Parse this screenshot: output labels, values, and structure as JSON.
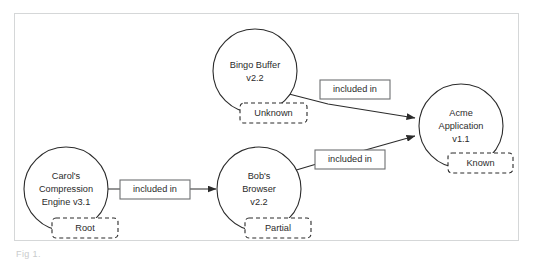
{
  "diagram": {
    "type": "dependency-graph",
    "caption": "Fig 1.",
    "frame_color": "#d5d7d8",
    "stroke_color": "#2b2b2b",
    "label_box_stroke": "#6e7072",
    "background": "#ffffff",
    "nodes": [
      {
        "id": "bingo-buffer",
        "name": "Bingo Buffer",
        "line1": "Bingo Buffer",
        "line2": "v2.2",
        "badge": "Unknown",
        "cx": 255,
        "cy": 71,
        "r": 42
      },
      {
        "id": "acme-application",
        "name": "Acme Application",
        "line1": "Acme",
        "line2": "Application",
        "line3": "v1.1",
        "badge": "Known",
        "cx": 461,
        "cy": 126,
        "r": 42
      },
      {
        "id": "carols-compression-engine",
        "name": "Carol's Compression Engine",
        "line1": "Carol's",
        "line2": "Compression",
        "line3": "Engine v3.1",
        "badge": "Root",
        "cx": 66,
        "cy": 189,
        "r": 42
      },
      {
        "id": "bobs-browser",
        "name": "Bob's Browser",
        "line1": "Bob's",
        "line2": "Browser",
        "line3": "v2.2",
        "badge": "Partial",
        "cx": 259,
        "cy": 189,
        "r": 42
      }
    ],
    "edges": [
      {
        "id": "edge-bingo-to-acme",
        "from": "bingo-buffer",
        "to": "acme-application",
        "label": "included in"
      },
      {
        "id": "edge-bobs-to-acme",
        "from": "bobs-browser",
        "to": "acme-application",
        "label": "included in"
      },
      {
        "id": "edge-carols-to-bobs",
        "from": "carols-compression-engine",
        "to": "bobs-browser",
        "label": "included in"
      }
    ]
  }
}
